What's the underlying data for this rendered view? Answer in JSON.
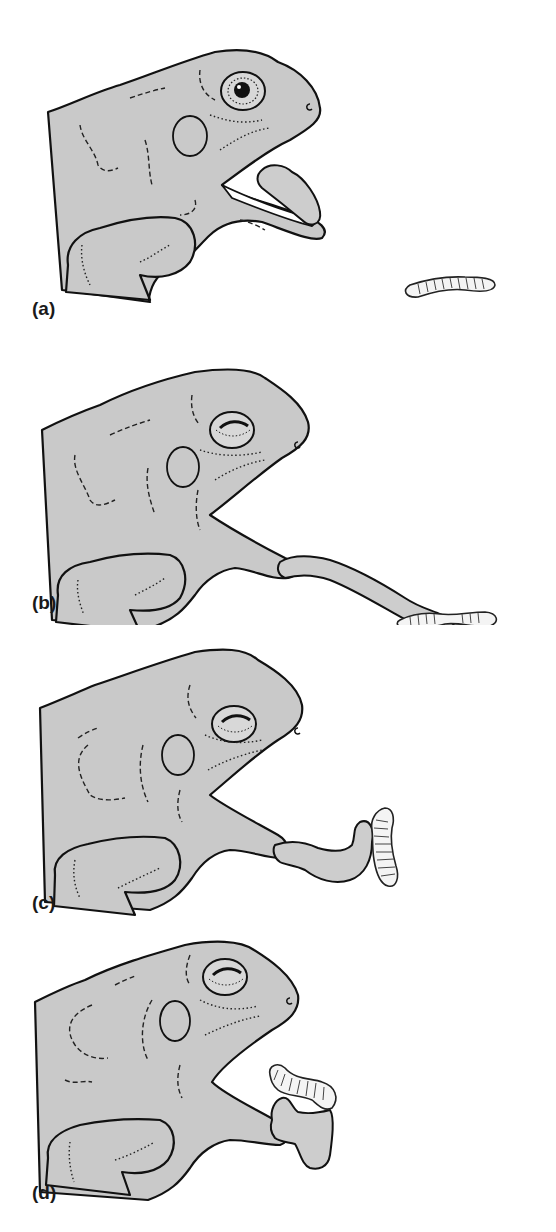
{
  "figure": {
    "colors": {
      "background": "#ffffff",
      "frog_skin": "#c9c9c9",
      "outline": "#111111",
      "worm": "#f4f4f4"
    },
    "panels": [
      {
        "id": "a",
        "label": "(a)",
        "stage": "mouth opening, tongue folded inside, worm on ground"
      },
      {
        "id": "b",
        "label": "(b)",
        "stage": "tongue fully extended reaching worm"
      },
      {
        "id": "c",
        "label": "(c)",
        "stage": "tongue tip wraps worm and lifts it"
      },
      {
        "id": "d",
        "label": "(d)",
        "stage": "tongue retracting worm into mouth"
      }
    ]
  }
}
